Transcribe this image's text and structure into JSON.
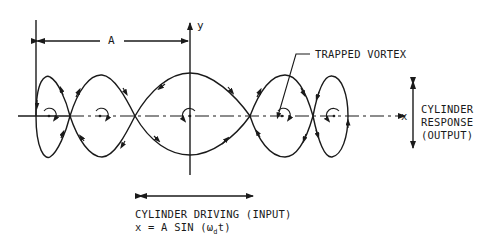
{
  "diagram": {
    "labels": {
      "dimension": "A",
      "y_axis": "y",
      "x_axis": "x",
      "trapped_vortex": "TRAPPED VORTEX",
      "response_line1": "CYLINDER",
      "response_line2": "RESPONSE",
      "response_line3": "(OUTPUT)",
      "driving_line1": "CYLINDER DRIVING (INPUT)",
      "formula_prefix": "x = A SIN (ω",
      "formula_sub": "d",
      "formula_suffix": "t)"
    },
    "loops": [
      {
        "name": "loop-1",
        "x_start": 36,
        "x_end": 70
      },
      {
        "name": "loop-2",
        "x_start": 70,
        "x_end": 135
      },
      {
        "name": "loop-3",
        "x_start": 135,
        "x_end": 250
      },
      {
        "name": "loop-4",
        "x_start": 250,
        "x_end": 313
      },
      {
        "name": "loop-5",
        "x_start": 313,
        "x_end": 350
      }
    ],
    "vortex_centers": [
      49,
      100,
      190,
      282,
      334
    ],
    "line_color": "#1a1a1a"
  }
}
